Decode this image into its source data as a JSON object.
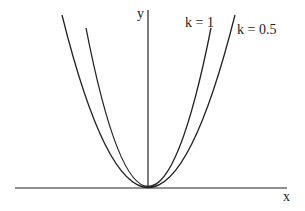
{
  "diagram": {
    "axes": {
      "x_label": "x",
      "y_label": "y"
    },
    "curves": [
      {
        "label": "k = 1",
        "description": "narrower parabola"
      },
      {
        "label": "k = 0.5",
        "description": "wider parabola"
      }
    ],
    "stroke_color": "#222222",
    "background": "#ffffff"
  }
}
